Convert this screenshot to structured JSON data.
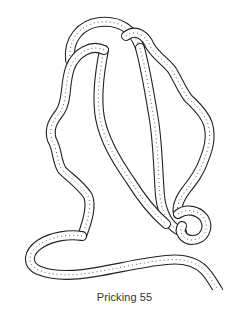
{
  "figure": {
    "line_color": "#222222",
    "background": "#ffffff"
  },
  "caption": {
    "text": "Pricking 55"
  }
}
